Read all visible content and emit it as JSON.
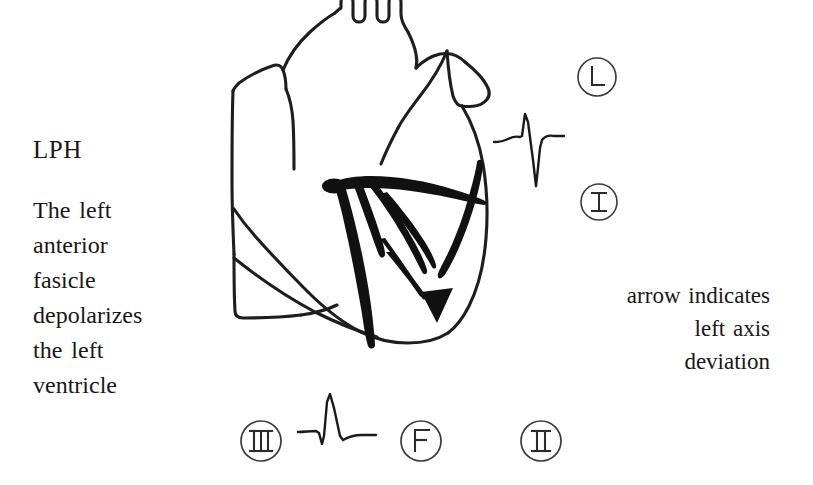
{
  "figure": {
    "kind": "hand-drawn-anatomical-heart-diagram",
    "topic": "Left posterior hemiblock / left anterior fascicle depolarization",
    "background_color": "#ffffff",
    "ink_color": "#1a1a1a"
  },
  "labels": {
    "title": "LPH",
    "left_description": "The  left\nanterior\nfasicle\ndepolarizes\nthe  left\nventricle",
    "right_description": "arrow  indicates\nleft  axis\ndeviation"
  },
  "leads": [
    {
      "name": "lead-avl",
      "text": "L",
      "style": "plain",
      "x": 576,
      "y": 56
    },
    {
      "name": "lead-i",
      "text": "I",
      "style": "serif-bars",
      "x": 578,
      "y": 181
    },
    {
      "name": "lead-iii",
      "text": "III",
      "style": "serif-bars",
      "x": 238,
      "y": 418
    },
    {
      "name": "lead-avf",
      "text": "F",
      "style": "plain",
      "x": 398,
      "y": 418
    },
    {
      "name": "lead-ii",
      "text": "II",
      "style": "serif-bars",
      "x": 518,
      "y": 418
    }
  ],
  "waveforms": [
    {
      "name": "ecg-trace-upper",
      "lead_association": "L",
      "morphology": "tall R wave with deep S wave (left axis deviation)",
      "x": 492,
      "y": 108
    },
    {
      "name": "ecg-trace-lower",
      "lead_association": "F",
      "morphology": "small q, tall R, small s",
      "x": 296,
      "y": 392
    }
  ],
  "anatomy": {
    "aortic_arch_branches": 3,
    "conduction_system": "bold left bundle branch with anterior fascicle ramifications",
    "arrow": "downward-left-axis-arrow"
  },
  "colors": {
    "ink": "#1a1a1a",
    "outline": "#222222",
    "paper": "#ffffff"
  }
}
